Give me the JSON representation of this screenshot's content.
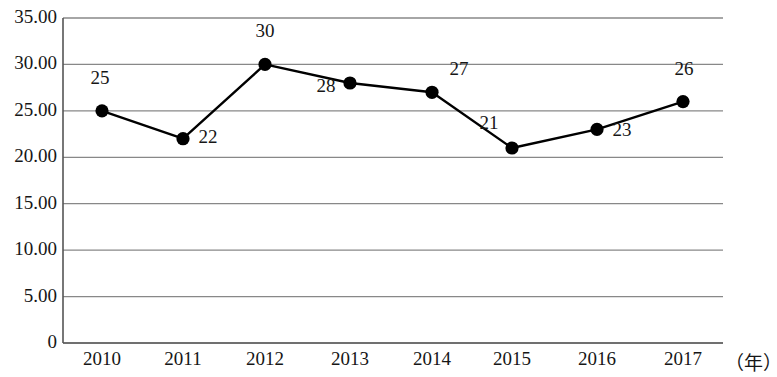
{
  "chart_data": {
    "type": "line",
    "title": "",
    "xlabel": "（年）",
    "ylabel": "",
    "categories": [
      "2010",
      "2011",
      "2012",
      "2013",
      "2014",
      "2015",
      "2016",
      "2017"
    ],
    "values": [
      25,
      22,
      30,
      28,
      27,
      21,
      23,
      26
    ],
    "point_labels": [
      "25",
      "22",
      "30",
      "28",
      "27",
      "21",
      "23",
      "26"
    ],
    "series": [
      {
        "name": "",
        "values": [
          25,
          22,
          30,
          28,
          27,
          21,
          23,
          26
        ]
      }
    ],
    "ylim": [
      0,
      35
    ],
    "y_tick_values": [
      0,
      5,
      10,
      15,
      20,
      25,
      30,
      35
    ],
    "y_tick_labels": [
      "0",
      "5.00",
      "10.00",
      "15.00",
      "20.00",
      "25.00",
      "30.00",
      "35.00"
    ],
    "grid": true,
    "legend": "none",
    "marker": "filled-circle",
    "line_color": "#000000",
    "marker_color": "#000000",
    "grid_color": "#888888",
    "axis_color": "#555555"
  },
  "axes": {
    "y_axis_name": "value-axis",
    "x_axis_name": "year-axis",
    "x_unit": "（年）"
  }
}
